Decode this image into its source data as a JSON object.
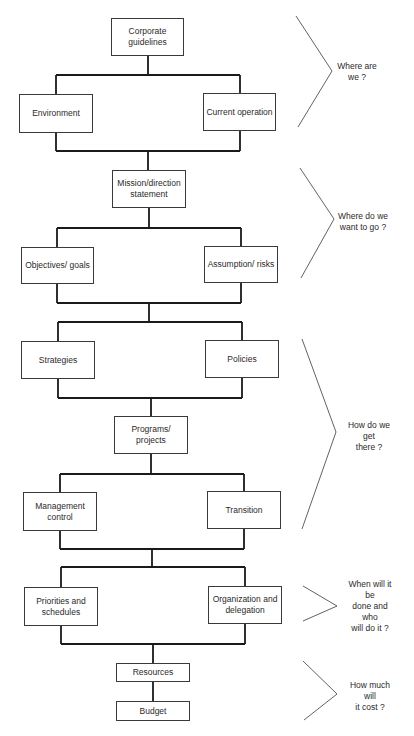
{
  "diagram": {
    "type": "planning-process-flowchart",
    "nodes": [
      {
        "id": "corporate",
        "label": "Corporate guidelines",
        "x": 111,
        "y": 18,
        "w": 73,
        "h": 38
      },
      {
        "id": "environment",
        "label": "Environment",
        "x": 19,
        "y": 94,
        "w": 74,
        "h": 39
      },
      {
        "id": "current",
        "label": "Current operation",
        "x": 203,
        "y": 93,
        "w": 73,
        "h": 38
      },
      {
        "id": "mission",
        "label": "Mission/direction statement",
        "x": 112,
        "y": 170,
        "w": 74,
        "h": 38
      },
      {
        "id": "objectives",
        "label": "Objectives/ goals",
        "x": 21,
        "y": 247,
        "w": 73,
        "h": 37
      },
      {
        "id": "assumption",
        "label": "Assumption/ risks",
        "x": 204,
        "y": 246,
        "w": 74,
        "h": 37
      },
      {
        "id": "strategies",
        "label": "Strategies",
        "x": 21,
        "y": 341,
        "w": 74,
        "h": 38
      },
      {
        "id": "policies",
        "label": "Policies",
        "x": 205,
        "y": 340,
        "w": 74,
        "h": 38
      },
      {
        "id": "programs",
        "label": "Programs/ projects",
        "x": 114,
        "y": 416,
        "w": 74,
        "h": 38
      },
      {
        "id": "management",
        "label": "Management control",
        "x": 23,
        "y": 492,
        "w": 74,
        "h": 39
      },
      {
        "id": "transition",
        "label": "Transition",
        "x": 207,
        "y": 491,
        "w": 74,
        "h": 38
      },
      {
        "id": "priorities",
        "label": "Priorities and schedules",
        "x": 24,
        "y": 587,
        "w": 74,
        "h": 39
      },
      {
        "id": "organization",
        "label": "Organization and delegation",
        "x": 208,
        "y": 586,
        "w": 74,
        "h": 38
      },
      {
        "id": "resources",
        "label": "Resources",
        "x": 116,
        "y": 663,
        "w": 74,
        "h": 19
      },
      {
        "id": "budget",
        "label": "Budget",
        "x": 116,
        "y": 701,
        "w": 74,
        "h": 20
      }
    ],
    "edges": [
      [
        "corporate",
        "environment"
      ],
      [
        "corporate",
        "current"
      ],
      [
        "environment",
        "mission"
      ],
      [
        "current",
        "mission"
      ],
      [
        "mission",
        "objectives"
      ],
      [
        "mission",
        "assumption"
      ],
      [
        "objectives",
        "strategies"
      ],
      [
        "objectives",
        "policies"
      ],
      [
        "assumption",
        "strategies"
      ],
      [
        "assumption",
        "policies"
      ],
      [
        "strategies",
        "programs"
      ],
      [
        "policies",
        "programs"
      ],
      [
        "programs",
        "management"
      ],
      [
        "programs",
        "transition"
      ],
      [
        "management",
        "priorities"
      ],
      [
        "management",
        "organization"
      ],
      [
        "transition",
        "priorities"
      ],
      [
        "transition",
        "organization"
      ],
      [
        "priorities",
        "resources"
      ],
      [
        "organization",
        "resources"
      ],
      [
        "resources",
        "budget"
      ]
    ],
    "questions": [
      {
        "id": "q1",
        "label": "Where are\nwe ?",
        "cx": 357,
        "cy": 72,
        "bracket": {
          "top": [
            296,
            16
          ],
          "apex": [
            332,
            71
          ],
          "bottom": [
            298,
            127
          ]
        }
      },
      {
        "id": "q2",
        "label": "Where do we\nwant to go ?",
        "cx": 363,
        "cy": 222,
        "bracket": {
          "top": [
            300,
            168
          ],
          "apex": [
            334,
            219
          ],
          "bottom": [
            301,
            278
          ]
        }
      },
      {
        "id": "q3",
        "label": "How do we get\nthere ?",
        "cx": 369,
        "cy": 436,
        "bracket": {
          "top": [
            302,
            339
          ],
          "apex": [
            336,
            432
          ],
          "bottom": [
            302,
            529
          ]
        }
      },
      {
        "id": "q4",
        "label": "When will it be\ndone and who\nwill do it ?",
        "cx": 370,
        "cy": 606,
        "bracket": {
          "top": [
            303,
            586
          ],
          "apex": [
            337,
            606
          ],
          "bottom": [
            303,
            621
          ]
        }
      },
      {
        "id": "q5",
        "label": "How much will\nit cost ?",
        "cx": 370,
        "cy": 696,
        "bracket": {
          "top": [
            303,
            661
          ],
          "apex": [
            337,
            694
          ],
          "bottom": [
            304,
            720
          ]
        }
      }
    ],
    "connector_paths": [
      "M148 56 V75 M56 75 H240 M56 75 V94 M240 75 V93",
      "M56 133 V151 M240 131 V151 M56 151 H240 M148 151 V170",
      "M149 208 V228 M57 228 H241 M57 228 V247 M241 228 V246",
      "M57 284 V303 M241 283 V303 M57 303 H241 M149 303 V322",
      "M58 322 H242 M58 322 V341 M242 322 V340",
      "M58 379 V398 M242 378 V398 M58 398 H242 M151 398 V416",
      "M151 454 V474 M60 474 H244 M60 474 V492 M244 474 V491",
      "M60 531 V549 M244 529 V549 M60 549 H244 M152 549 V567",
      "M61 567 H245 M61 567 V587 M245 567 V586",
      "M61 626 V644 M245 624 V644 M61 644 H245 M153 644 V663",
      "M153 682 V701"
    ]
  }
}
